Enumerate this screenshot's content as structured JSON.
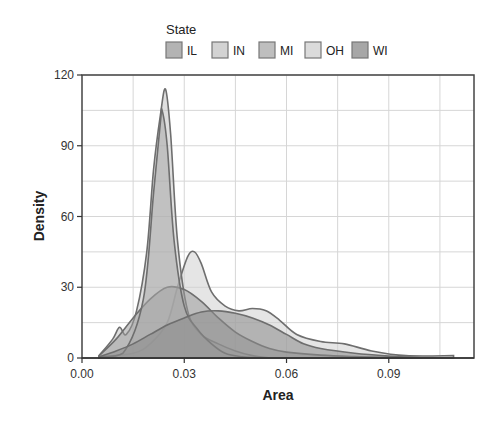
{
  "chart_data": {
    "type": "area",
    "subtype": "density",
    "title": "",
    "xlabel": "Area",
    "ylabel": "Density",
    "xlim": [
      0.0,
      0.115
    ],
    "ylim": [
      0,
      120
    ],
    "xticks": [
      0.0,
      0.03,
      0.06,
      0.09
    ],
    "xtick_labels": [
      "0.00",
      "0.03",
      "0.06",
      "0.09"
    ],
    "yticks": [
      0,
      30,
      60,
      90,
      120
    ],
    "ytick_labels": [
      "0",
      "30",
      "60",
      "90",
      "120"
    ],
    "grid": true,
    "legend": {
      "title": "State",
      "position": "top",
      "entries": [
        "IL",
        "IN",
        "MI",
        "OH",
        "WI"
      ]
    },
    "series": [
      {
        "name": "IL",
        "color": "#9a9a9a",
        "x": [
          0.005,
          0.01,
          0.015,
          0.02,
          0.025,
          0.03,
          0.035,
          0.04,
          0.045,
          0.05,
          0.055,
          0.06,
          0.07,
          0.08,
          0.09,
          0.1,
          0.109
        ],
        "y": [
          1,
          8,
          17,
          25,
          30,
          29,
          24,
          17,
          11,
          7,
          4,
          2.5,
          1.2,
          0.6,
          0.3,
          0.1,
          0
        ]
      },
      {
        "name": "IN",
        "color": "#c4c4c4",
        "x": [
          0.005,
          0.009,
          0.011,
          0.013,
          0.016,
          0.019,
          0.021,
          0.023,
          0.0245,
          0.026,
          0.028,
          0.031,
          0.035,
          0.04,
          0.045,
          0.05,
          0.055
        ],
        "y": [
          1,
          8,
          13,
          10,
          20,
          45,
          80,
          103,
          114,
          95,
          50,
          20,
          10,
          6,
          3,
          1,
          0
        ]
      },
      {
        "name": "MI",
        "color": "#a8a8a8",
        "x": [
          0.005,
          0.012,
          0.018,
          0.021,
          0.023,
          0.0235,
          0.025,
          0.027,
          0.03,
          0.034,
          0.038,
          0.042,
          0.047,
          0.052
        ],
        "y": [
          0.5,
          2,
          25,
          70,
          100,
          105,
          90,
          50,
          22,
          12,
          6,
          2,
          0.5,
          0
        ]
      },
      {
        "name": "OH",
        "color": "#cfcfcf",
        "x": [
          0.005,
          0.015,
          0.02,
          0.025,
          0.028,
          0.031,
          0.033,
          0.035,
          0.038,
          0.042,
          0.046,
          0.05,
          0.054,
          0.058,
          0.063,
          0.07,
          0.077,
          0.085,
          0.095,
          0.109
        ],
        "y": [
          0.5,
          2,
          6,
          15,
          30,
          43,
          45,
          40,
          28,
          22,
          20,
          21,
          20,
          16,
          10,
          7,
          6,
          3,
          1,
          1
        ]
      },
      {
        "name": "WI",
        "color": "#8a8a8a",
        "x": [
          0.005,
          0.01,
          0.015,
          0.02,
          0.025,
          0.03,
          0.035,
          0.04,
          0.045,
          0.05,
          0.055,
          0.06,
          0.065,
          0.07,
          0.08,
          0.09,
          0.1
        ],
        "y": [
          0.5,
          3,
          6,
          10,
          14,
          17,
          19.5,
          20,
          19,
          17,
          14,
          10,
          6,
          4,
          2,
          0.8,
          0
        ]
      }
    ]
  }
}
